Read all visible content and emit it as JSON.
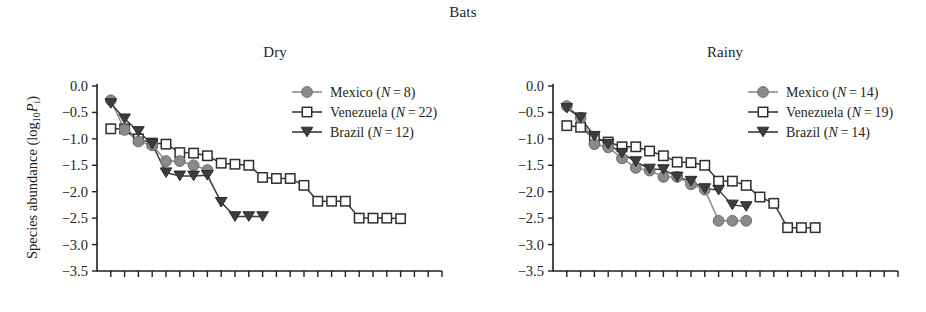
{
  "figure": {
    "title": "Bats",
    "ylabel_prefix": "Species abundance (log",
    "ylabel_sub": "10",
    "ylabel_var": "P",
    "ylabel_varsub": "i",
    "ylabel_suffix": ")",
    "colors": {
      "mexico": "#8a8a8a",
      "venezuela": "#ffffff",
      "venezuela_stroke": "#2e2e2e",
      "brazil": "#3d3d3d",
      "axis": "#231f20"
    }
  },
  "chart_data": [
    {
      "type": "line",
      "title": "Dry",
      "panel": "left",
      "xlabel": "",
      "ylabel": "Species abundance (log10Pi)",
      "ylim": [
        -3.5,
        0.0
      ],
      "yticks": [
        "0.0",
        "-0.5",
        "-1.0",
        "-1.5",
        "-2.0",
        "-2.5",
        "-3.0",
        "-3.5"
      ],
      "ytick_values": [
        0.0,
        -0.5,
        -1.0,
        -1.5,
        -2.0,
        -2.5,
        -3.0,
        -3.5
      ],
      "xlim": [
        0,
        25
      ],
      "x_tick_count": 25,
      "x_ticks_labeled": false,
      "grid": false,
      "legend_position": "top-right",
      "series": [
        {
          "name": "Mexico",
          "n_label": "N",
          "n_value": "8",
          "legend": "Mexico (N = 8)",
          "marker": "circle",
          "color": "#8a8a8a",
          "x": [
            1,
            2,
            3,
            4,
            5,
            6,
            7,
            8
          ],
          "values": [
            -0.27,
            -0.83,
            -1.05,
            -1.12,
            -1.42,
            -1.42,
            -1.5,
            -1.59
          ]
        },
        {
          "name": "Venezuela",
          "n_label": "N",
          "n_value": "22",
          "legend": "Venezuela (N = 22)",
          "marker": "open-square",
          "color": "#ffffff",
          "x": [
            1,
            2,
            3,
            4,
            5,
            6,
            7,
            8,
            9,
            10,
            11,
            12,
            13,
            14,
            15,
            16,
            17,
            18,
            19,
            20,
            21,
            22
          ],
          "values": [
            -0.81,
            -0.81,
            -1.0,
            -1.08,
            -1.1,
            -1.26,
            -1.27,
            -1.32,
            -1.46,
            -1.48,
            -1.5,
            -1.73,
            -1.75,
            -1.75,
            -1.88,
            -2.18,
            -2.18,
            -2.18,
            -2.5,
            -2.5,
            -2.5,
            -2.51
          ]
        },
        {
          "name": "Brazil",
          "n_label": "N",
          "n_value": "12",
          "legend": "Brazil (N = 12)",
          "marker": "triangle-down",
          "color": "#3d3d3d",
          "x": [
            1,
            2,
            3,
            4,
            5,
            6,
            7,
            8,
            9,
            10,
            11,
            12
          ],
          "values": [
            -0.33,
            -0.62,
            -0.86,
            -1.1,
            -1.64,
            -1.7,
            -1.7,
            -1.69,
            -2.2,
            -2.47,
            -2.47,
            -2.47
          ]
        }
      ]
    },
    {
      "type": "line",
      "title": "Rainy",
      "panel": "right",
      "xlabel": "",
      "ylabel": "",
      "ylim": [
        -3.5,
        0.0
      ],
      "yticks": [
        "0.0",
        "-0.5",
        "-1.0",
        "-1.5",
        "-2.0",
        "-2.5",
        "-3.0",
        "-3.5"
      ],
      "ytick_values": [
        0.0,
        -0.5,
        -1.0,
        -1.5,
        -2.0,
        -2.5,
        -3.0,
        -3.5
      ],
      "xlim": [
        0,
        25
      ],
      "x_tick_count": 25,
      "x_ticks_labeled": false,
      "grid": false,
      "legend_position": "top-right",
      "series": [
        {
          "name": "Mexico",
          "n_label": "N",
          "n_value": "14",
          "legend": "Mexico (N = 14)",
          "marker": "circle",
          "color": "#8a8a8a",
          "x": [
            1,
            2,
            3,
            4,
            5,
            6,
            7,
            8,
            9,
            10,
            11,
            12,
            13,
            14
          ],
          "values": [
            -0.38,
            -0.6,
            -1.1,
            -1.16,
            -1.37,
            -1.55,
            -1.6,
            -1.72,
            -1.72,
            -1.86,
            -1.96,
            -2.55,
            -2.55,
            -2.55
          ]
        },
        {
          "name": "Venezuela",
          "n_label": "N",
          "n_value": "19",
          "legend": "Venezuela (N = 19)",
          "marker": "open-square",
          "color": "#ffffff",
          "x": [
            1,
            2,
            3,
            4,
            5,
            6,
            7,
            8,
            9,
            10,
            11,
            12,
            13,
            14,
            15,
            16,
            17,
            18,
            19
          ],
          "values": [
            -0.75,
            -0.78,
            -1.0,
            -1.06,
            -1.15,
            -1.15,
            -1.23,
            -1.32,
            -1.44,
            -1.45,
            -1.5,
            -1.8,
            -1.8,
            -1.88,
            -2.1,
            -2.22,
            -2.68,
            -2.68,
            -2.68
          ]
        },
        {
          "name": "Brazil",
          "n_label": "N",
          "n_value": "14",
          "legend": "Brazil (N = 14)",
          "marker": "triangle-down",
          "color": "#3d3d3d",
          "x": [
            1,
            2,
            3,
            4,
            5,
            6,
            7,
            8,
            9,
            10,
            11,
            12,
            13,
            14
          ],
          "values": [
            -0.42,
            -0.6,
            -0.95,
            -1.1,
            -1.27,
            -1.43,
            -1.57,
            -1.58,
            -1.72,
            -1.8,
            -1.94,
            -1.97,
            -2.25,
            -2.28
          ]
        }
      ]
    }
  ]
}
